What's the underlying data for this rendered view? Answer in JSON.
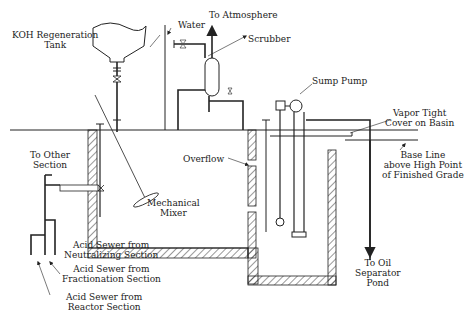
{
  "diagram": {
    "type": "process-schematic",
    "line_color": "#222222",
    "background": "#ffffff"
  },
  "labels": {
    "koh_tank": [
      "KOH Regeneration",
      "Tank"
    ],
    "water": "Water",
    "to_atmosphere": "To Atmosphere",
    "scrubber": "Scrubber",
    "sump_pump": "Sump Pump",
    "vapor_cover": [
      "Vapor Tight",
      "Cover on Basin"
    ],
    "base_line": [
      "Base Line",
      "above High Point",
      "of Finished Grade"
    ],
    "to_other_section": [
      "To Other",
      "Section"
    ],
    "overflow": "Overflow",
    "mechanical_mixer": [
      "Mechanical",
      "Mixer"
    ],
    "acid_sewer_neutralizing": [
      "Acid Sewer from",
      "Neutralizing Section"
    ],
    "acid_sewer_fractionation": [
      "Acid Sewer from",
      "Fractionation Section"
    ],
    "acid_sewer_reactor": [
      "Acid Sewer from",
      "Reactor Section"
    ],
    "to_oil_separator": [
      "To Oil",
      "Separator",
      "Pond"
    ]
  }
}
